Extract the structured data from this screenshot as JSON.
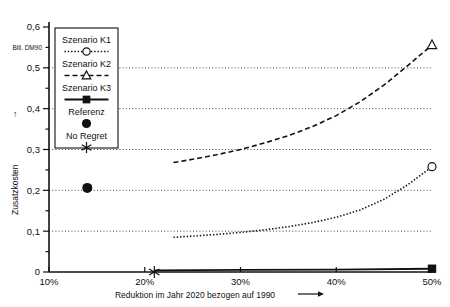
{
  "chart_data": {
    "type": "line",
    "title": "",
    "xlabel": "Reduktion im Jahr 2020 bezogen auf 1990",
    "ylabel": "Zusatzkosten",
    "yunit": "Bill. DM90",
    "xlim": [
      10,
      50
    ],
    "ylim": [
      0,
      0.6
    ],
    "grid": true,
    "gridlines_y": [
      0.1,
      0.2,
      0.3,
      0.4,
      0.5
    ],
    "xticks": [
      10,
      20,
      30,
      40,
      50
    ],
    "xtick_labels": [
      "10%",
      "20%",
      "30%",
      "40%",
      "50%"
    ],
    "yticks": [
      0,
      0.05,
      0.1,
      0.15,
      0.2,
      0.25,
      0.3,
      0.35,
      0.4,
      0.45,
      0.5,
      0.55,
      0.6
    ],
    "ytick_labels": [
      "0",
      "0,1",
      "0,2",
      "0,3",
      "0,4",
      "0,5",
      "0,6"
    ],
    "ytick_labeled_values": [
      0,
      0.1,
      0.2,
      0.3,
      0.4,
      0.5,
      0.6
    ],
    "legend_position": "upper-left-inside",
    "series": [
      {
        "name": "Szenario K1",
        "style": "dotted",
        "marker": "circle-open",
        "x": [
          23,
          25,
          27.5,
          30,
          32.5,
          35,
          37.5,
          40,
          42.5,
          45,
          47.5,
          50
        ],
        "values": [
          0.085,
          0.088,
          0.092,
          0.097,
          0.103,
          0.111,
          0.121,
          0.134,
          0.152,
          0.178,
          0.214,
          0.258
        ]
      },
      {
        "name": "Szenario K2",
        "style": "dashed",
        "marker": "triangle-open",
        "x": [
          23,
          25,
          27.5,
          30,
          32.5,
          35,
          37.5,
          40,
          42.5,
          45,
          47.5,
          50
        ],
        "values": [
          0.268,
          0.276,
          0.287,
          0.3,
          0.316,
          0.334,
          0.356,
          0.383,
          0.417,
          0.458,
          0.506,
          0.556
        ]
      },
      {
        "name": "Szenario K3",
        "style": "solid",
        "marker": "square-filled",
        "x": [
          21,
          30,
          40,
          50
        ],
        "values": [
          0.004,
          0.005,
          0.006,
          0.008
        ]
      }
    ],
    "points": [
      {
        "name": "Referenz",
        "marker": "circle-filled",
        "x": 14,
        "y": 0.206
      },
      {
        "name": "No Regret",
        "marker": "asterisk",
        "x": 21,
        "y": 0.0
      }
    ],
    "annotations": {
      "y_axis_arrow": "↑",
      "x_axis_arrow": "⟶"
    }
  },
  "legend": {
    "items": [
      {
        "label": "Szenario K1",
        "marker": "circle-open",
        "style": "dotted"
      },
      {
        "label": "Szenario K2",
        "marker": "triangle-open",
        "style": "dashed"
      },
      {
        "label": "Szenario K3",
        "marker": "square-filled",
        "style": "solid"
      },
      {
        "label": "Referenz",
        "marker": "circle-filled",
        "style": "none"
      },
      {
        "label": "No Regret",
        "marker": "asterisk",
        "style": "none"
      }
    ]
  },
  "axes": {
    "y_unit_label": "Bill. DM90",
    "y_title": "Zusatzkosten",
    "x_title": "Reduktion im Jahr 2020 bezogen auf 1990",
    "y_labels": [
      "0,6",
      "0,5",
      "0,4",
      "0,3",
      "0,2",
      "0,1",
      "0"
    ],
    "x_labels": [
      "10%",
      "20%",
      "30%",
      "40%",
      "50%"
    ]
  }
}
